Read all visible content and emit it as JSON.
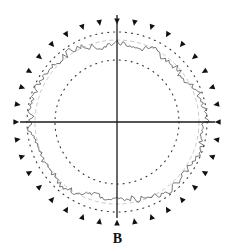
{
  "panel_label": "B",
  "colors": {
    "axis": "#1a1a1a",
    "trace": "#555555",
    "reference_ring": "#c8c8c8",
    "dots": "#333333",
    "markers": "#111111"
  },
  "chart_data": {
    "type": "polar",
    "title": "",
    "panel_label": "B",
    "center_px": [
      117,
      122
    ],
    "axes": {
      "horizontal_extent_px": [
        20,
        215
      ],
      "vertical_extent_px": [
        15,
        218
      ],
      "grid": false,
      "tick_labels": []
    },
    "rings": [
      {
        "name": "inner-dotted-circle",
        "radius_px": 62,
        "style": "dotted"
      },
      {
        "name": "reference-dashed-circle",
        "radius_px": 82,
        "style": "dashed-light"
      },
      {
        "name": "outer-dotted-circle",
        "radius_px": 90,
        "style": "dotted"
      },
      {
        "name": "triangle-marker-ring",
        "radius_px": 101,
        "count": 36,
        "style": "inward-triangles"
      }
    ],
    "series": [
      {
        "name": "irregular-trace",
        "description": "Jagged closed radial profile around the center, radius roughly 76-96 px",
        "mean_radius_px": 84,
        "radius_range_px": [
          74,
          97
        ]
      }
    ],
    "legend": []
  }
}
